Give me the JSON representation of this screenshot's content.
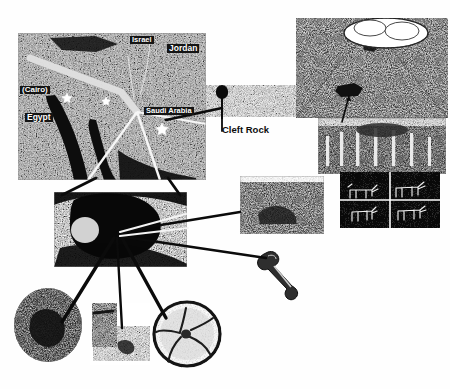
{
  "figure": {
    "kind": "annotated-photo-collage",
    "background_color": "#ffffff",
    "ink_color": "#111111"
  },
  "map": {
    "name": "satellite-relief-map",
    "labels": [
      {
        "id": "israel",
        "text": "Israel",
        "x": 130,
        "y": 38,
        "size": 7.5
      },
      {
        "id": "jordan",
        "text": "Jordan",
        "x": 168,
        "y": 46,
        "size": 8.5
      },
      {
        "id": "cairo",
        "text": "(Cairo)",
        "x": 20,
        "y": 88,
        "size": 8.0
      },
      {
        "id": "egypt",
        "text": "Egypt",
        "x": 25,
        "y": 115,
        "size": 8.5
      },
      {
        "id": "saudi_arabia",
        "text": "Saudi Arabia",
        "x": 146,
        "y": 109,
        "size": 7.5
      }
    ],
    "markers": [
      {
        "id": "star-sinai-traditional",
        "shape": "star",
        "x": 67,
        "y": 97
      },
      {
        "id": "star-goshen",
        "shape": "star",
        "x": 106,
        "y": 101
      },
      {
        "id": "star-jabal-al-lawz",
        "shape": "star",
        "x": 162,
        "y": 127
      }
    ]
  },
  "callouts": {
    "cleft_rock": {
      "label": "Cleft Rock",
      "pin_color": "#111111",
      "x": 222,
      "y": 131
    }
  },
  "photos": [
    {
      "id": "satellite-map-photo",
      "name": "map-photo",
      "x": 18,
      "y": 33,
      "w": 188,
      "h": 147
    },
    {
      "id": "mountain-photo",
      "name": "smoking-mountain",
      "x": 296,
      "y": 18,
      "w": 152,
      "h": 100
    },
    {
      "id": "altar-columns-photo",
      "name": "stone-columns-altar",
      "x": 318,
      "y": 118,
      "w": 128,
      "h": 56
    },
    {
      "id": "petroglyph-grid-photo",
      "name": "bovine-petroglyphs",
      "x": 340,
      "y": 172,
      "w": 100,
      "h": 56
    },
    {
      "id": "rocky-outcrop-photo",
      "name": "rocky-outcrop",
      "x": 240,
      "y": 176,
      "w": 84,
      "h": 58
    },
    {
      "id": "blackened-peak-photo",
      "name": "blackened-summit",
      "x": 54,
      "y": 192,
      "w": 133,
      "h": 75
    },
    {
      "id": "bone-artifact",
      "name": "bone-artifact",
      "x": 258,
      "y": 248,
      "w": 47,
      "h": 45
    },
    {
      "id": "boulder-photo",
      "name": "split-boulder",
      "x": 14,
      "y": 288,
      "w": 68,
      "h": 75
    },
    {
      "id": "pillar-photo",
      "name": "standing-pillar",
      "x": 90,
      "y": 303,
      "w": 60,
      "h": 62
    },
    {
      "id": "round-altar-photo",
      "name": "circular-altar",
      "x": 152,
      "y": 300,
      "w": 70,
      "h": 68
    }
  ],
  "petroglyph_panels": [
    {
      "id": "panel-1",
      "figure": "bull"
    },
    {
      "id": "panel-2",
      "figure": "bull"
    },
    {
      "id": "panel-3",
      "figure": "calf"
    },
    {
      "id": "panel-4",
      "figure": "calf"
    }
  ],
  "connectors": [
    {
      "id": "map-to-cleftrock",
      "from": "satellite-map-photo",
      "to": "cleft_rock"
    },
    {
      "id": "cleftrock-to-mountain",
      "from": "cleft_rock",
      "to": "mountain-photo"
    },
    {
      "id": "mountain-to-columns",
      "from": "mountain-photo",
      "to": "altar-columns-photo"
    },
    {
      "id": "map-to-summit-left",
      "from": "satellite-map-photo",
      "to": "blackened-peak-photo"
    },
    {
      "id": "map-to-summit-right",
      "from": "satellite-map-photo",
      "to": "blackened-peak-photo"
    },
    {
      "id": "summit-to-outcrop",
      "from": "blackened-peak-photo",
      "to": "rocky-outcrop-photo"
    },
    {
      "id": "summit-to-bone",
      "from": "blackened-peak-photo",
      "to": "bone-artifact"
    },
    {
      "id": "summit-to-boulder",
      "from": "blackened-peak-photo",
      "to": "boulder-photo"
    },
    {
      "id": "summit-to-pillar",
      "from": "blackened-peak-photo",
      "to": "pillar-photo"
    },
    {
      "id": "summit-to-round-altar",
      "from": "blackened-peak-photo",
      "to": "round-altar-photo"
    }
  ]
}
